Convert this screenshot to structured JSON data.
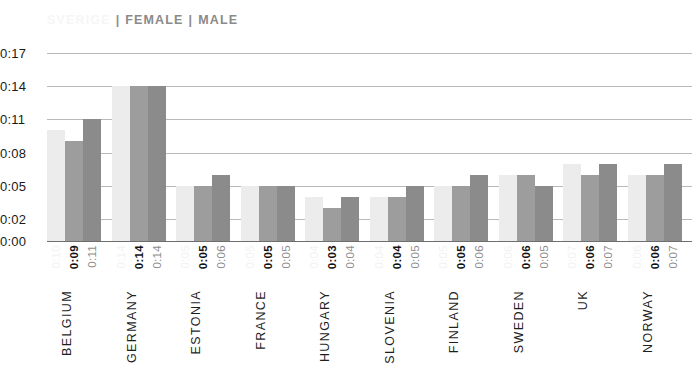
{
  "legend": {
    "items": [
      {
        "label": "SVERIGE",
        "color": "#ececec",
        "faded": true
      },
      {
        "label": "FEMALE",
        "color": "#9d9d9d",
        "faded": false
      },
      {
        "label": "MALE",
        "color": "#8b8b8b",
        "faded": false
      }
    ],
    "separator": "|"
  },
  "chart_data": {
    "type": "bar",
    "title": "",
    "subtitle": "",
    "xlabel": "",
    "ylabel": "",
    "grid": true,
    "legend_position": "top-left",
    "ylim": [
      0,
      17
    ],
    "y_unit": "minutes (m:ss as 0:MM)",
    "ytick_labels": [
      "0:17",
      "0:14",
      "0:11",
      "0:08",
      "0:05",
      "0:02",
      "0:00"
    ],
    "ytick_values": [
      17,
      14,
      11,
      8,
      5,
      2,
      0
    ],
    "categories": [
      "BELGIUM",
      "GERMANY",
      "ESTONIA",
      "FRANCE",
      "HUNGARY",
      "SLOVENIA",
      "FINLAND",
      "SWEDEN",
      "UK",
      "NORWAY"
    ],
    "series": [
      {
        "name": "SVERIGE",
        "color": "#ececec",
        "values": [
          10,
          14,
          5,
          5,
          4,
          4,
          5,
          6,
          7,
          6
        ],
        "labels": [
          "0:10",
          "0:14",
          "0:05",
          "0:05",
          "0:04",
          "0:04",
          "0:05",
          "0:06",
          "0:07",
          "0:06"
        ]
      },
      {
        "name": "FEMALE",
        "color": "#9d9d9d",
        "values": [
          9,
          14,
          5,
          5,
          3,
          4,
          5,
          6,
          6,
          6
        ],
        "labels": [
          "0:09",
          "0:14",
          "0:05",
          "0:05",
          "0:03",
          "0:04",
          "0:05",
          "0:06",
          "0:06",
          "0:06"
        ]
      },
      {
        "name": "MALE",
        "color": "#8b8b8b",
        "values": [
          11,
          14,
          6,
          5,
          4,
          5,
          6,
          5,
          7,
          7
        ],
        "labels": [
          "0:11",
          "0:14",
          "0:06",
          "0:05",
          "0:04",
          "0:05",
          "0:06",
          "0:05",
          "0:07",
          "0:07"
        ]
      }
    ]
  }
}
